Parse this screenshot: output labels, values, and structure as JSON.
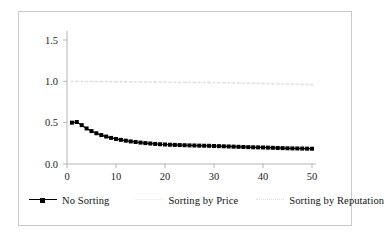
{
  "chart_data": {
    "type": "line",
    "title": "",
    "subtitle": "",
    "xlabel": "",
    "ylabel": "",
    "xlim": [
      0,
      50
    ],
    "ylim": [
      0.0,
      1.5
    ],
    "grid": false,
    "legend_position": "bottom",
    "x_ticks": [
      "0",
      "10",
      "20",
      "30",
      "40",
      "50"
    ],
    "x_tick_values": [
      0,
      10,
      20,
      30,
      40,
      50
    ],
    "y_ticks": [
      "0.0",
      "0.5",
      "1.0",
      "1.5"
    ],
    "y_tick_values": [
      0.0,
      0.5,
      1.0,
      1.5
    ],
    "x": [
      1,
      2,
      3,
      4,
      5,
      6,
      7,
      8,
      9,
      10,
      11,
      12,
      13,
      14,
      15,
      16,
      17,
      18,
      19,
      20,
      21,
      22,
      23,
      24,
      25,
      26,
      27,
      28,
      29,
      30,
      31,
      32,
      33,
      34,
      35,
      36,
      37,
      38,
      39,
      40,
      41,
      42,
      43,
      44,
      45,
      46,
      47,
      48,
      49,
      50
    ],
    "series": [
      {
        "name": "No Sorting",
        "color": "#000000",
        "marker": "square",
        "values": [
          0.5,
          0.508,
          0.47,
          0.43,
          0.398,
          0.372,
          0.35,
          0.332,
          0.316,
          0.303,
          0.292,
          0.282,
          0.273,
          0.266,
          0.259,
          0.253,
          0.248,
          0.243,
          0.239,
          0.236,
          0.233,
          0.231,
          0.229,
          0.227,
          0.225,
          0.224,
          0.222,
          0.221,
          0.22,
          0.218,
          0.216,
          0.214,
          0.212,
          0.21,
          0.208,
          0.206,
          0.204,
          0.202,
          0.201,
          0.2,
          0.198,
          0.196,
          0.194,
          0.192,
          0.19,
          0.189,
          0.188,
          0.187,
          0.186,
          0.185
        ]
      },
      {
        "name": "Sorting by Price",
        "color": "#f2f2f2",
        "marker": "none",
        "values": [
          null,
          null,
          null,
          null,
          null,
          null,
          null,
          null,
          null,
          null,
          null,
          null,
          null,
          null,
          null,
          null,
          null,
          null,
          null,
          null,
          null,
          null,
          null,
          null,
          null,
          null,
          null,
          null,
          null,
          null,
          null,
          null,
          null,
          null,
          null,
          null,
          null,
          null,
          null,
          null,
          null,
          null,
          null,
          null,
          null,
          null,
          null,
          null,
          null,
          null
        ]
      },
      {
        "name": "Sorting by Reputation",
        "color": "#e2e2e2",
        "marker": "square",
        "values": [
          0.998,
          0.999,
          0.999,
          0.998,
          0.998,
          0.997,
          0.997,
          0.996,
          0.996,
          0.995,
          0.994,
          0.994,
          0.993,
          0.993,
          0.992,
          0.992,
          0.991,
          0.991,
          0.99,
          0.99,
          0.989,
          0.989,
          0.988,
          0.988,
          0.987,
          0.986,
          0.986,
          0.985,
          0.984,
          0.984,
          0.983,
          0.982,
          0.981,
          0.98,
          0.979,
          0.978,
          0.977,
          0.976,
          0.975,
          0.974,
          0.972,
          0.971,
          0.97,
          0.968,
          0.967,
          0.966,
          0.964,
          0.963,
          0.962,
          0.96
        ]
      }
    ]
  },
  "legend": {
    "items": [
      {
        "label": "No Sorting"
      },
      {
        "label": "Sorting by Price"
      },
      {
        "label": "Sorting by Reputation"
      }
    ]
  }
}
